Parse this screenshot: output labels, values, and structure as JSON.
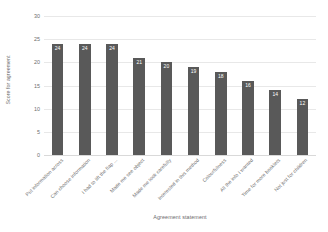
{
  "chart_data": {
    "type": "bar",
    "title": "",
    "xlabel": "Agreement statement",
    "ylabel": "Score for agreement",
    "categories": [
      "Put information across",
      "Can choose information",
      "I had to lift the flap ...",
      "Made me see object",
      "Made me look carefully",
      "Interested in this method",
      "Colourfulness",
      "All the info I wanted",
      "Time for more booklets",
      "Not just for children"
    ],
    "values": [
      24,
      24,
      24,
      21,
      20,
      19,
      18,
      16,
      14,
      12
    ],
    "ylim": [
      0,
      30
    ],
    "yticks": [
      0,
      5,
      10,
      15,
      20,
      25,
      30
    ],
    "ytick_labels": [
      "0",
      "5",
      "10",
      "15",
      "20",
      "25",
      "30"
    ],
    "grid": true,
    "legend": false,
    "bar_color": "#595959",
    "data_label_color": "#ffffff",
    "gridline_color": "#e8e8e8",
    "background_color": "#ffffff"
  }
}
